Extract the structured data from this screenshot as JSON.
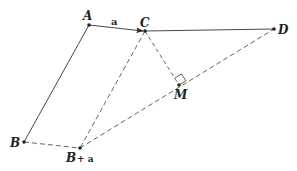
{
  "diagram": {
    "points": {
      "A": {
        "label": "A",
        "x": 89,
        "y": 25
      },
      "C": {
        "label": "C",
        "x": 145,
        "y": 31
      },
      "D": {
        "label": "D",
        "x": 274,
        "y": 29
      },
      "B": {
        "label": "B",
        "x": 24,
        "y": 142
      },
      "Ba": {
        "label": "B",
        "x": 80,
        "y": 148
      },
      "M": {
        "label": "M",
        "x": 179,
        "y": 85
      }
    },
    "vector_label": "a",
    "ba_suffix": "+ a",
    "line_color": "#333333",
    "dash_color": "#555555"
  }
}
